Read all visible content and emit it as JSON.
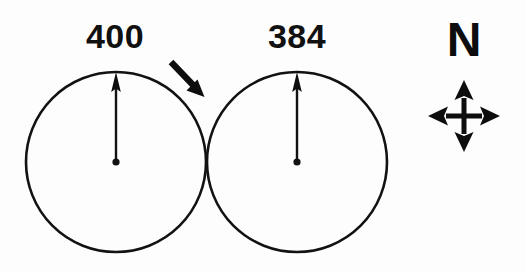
{
  "figure": {
    "background_color": "#fdfdfd",
    "ink_color": "#121212",
    "circles": [
      {
        "id": "circle-left",
        "label": "400",
        "label_x": 115,
        "label_y": 48,
        "center_x": 116,
        "center_y": 162,
        "radius": 90,
        "stroke_width": 2.6,
        "vector": {
          "name": "north-vector-left",
          "from_x": 116,
          "from_y": 162,
          "to_x": 116,
          "to_y": 73,
          "direction": "up",
          "stroke_width": 2.4,
          "head_width": 9,
          "head_length": 20
        },
        "center_dot_radius": 3.6
      },
      {
        "id": "circle-right",
        "label": "384",
        "label_x": 297,
        "label_y": 48,
        "center_x": 297,
        "center_y": 162,
        "radius": 90,
        "stroke_width": 2.6,
        "vector": {
          "name": "north-vector-right",
          "from_x": 297,
          "from_y": 162,
          "to_x": 297,
          "to_y": 73,
          "direction": "up",
          "stroke_width": 2.4,
          "head_width": 9,
          "head_length": 20
        },
        "center_dot_radius": 3.6
      }
    ],
    "pointer_arrow": {
      "name": "tangent-pointer-arrow",
      "from_x": 171,
      "from_y": 62,
      "to_x": 204,
      "to_y": 97,
      "direction": "down-right",
      "shaft_width": 6,
      "head_width": 17,
      "head_length": 19
    },
    "compass": {
      "letter": "N",
      "letter_x": 464,
      "letter_y": 56,
      "center_x": 464,
      "center_y": 116,
      "arm_length": 36,
      "shaft_width": 5,
      "head_width": 19,
      "head_length": 18,
      "directions": [
        "up",
        "right",
        "down",
        "left"
      ]
    }
  }
}
